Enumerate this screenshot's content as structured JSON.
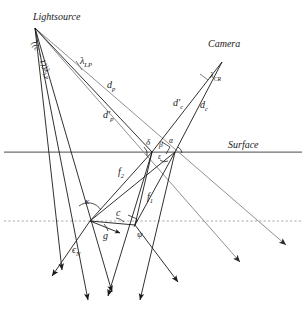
{
  "figure": {
    "type": "ray-diagram",
    "background": "#ffffff",
    "width": 306,
    "height": 319
  },
  "colors": {
    "ray_black": "#1a1a1a",
    "ray_gray": "#8a8a8a",
    "surface_line": "#6e6e6e",
    "dashed_line": "#a8a8a8",
    "text": "#1a1a1a"
  },
  "labels": {
    "lightsource": "Lightsource",
    "camera": "Camera",
    "surface": "Surface",
    "lambda_lp": "λ",
    "lambda_lp_sub": "LP",
    "cone_width": "((c − 1))λ",
    "cone_width_sub": "LP",
    "d_p": "d",
    "d_p_sub": "p",
    "d_p_prime": "d′",
    "d_p_prime_sub": "p",
    "lambda_cr": "λ",
    "lambda_cr_sub": "CR",
    "d_c": "d",
    "d_c_sub": "c",
    "d_c_prime": "d′",
    "d_c_prime_sub": "c",
    "f1": "f",
    "f1_sub": "1",
    "f2": "f",
    "f2_sub": "2",
    "delta": "δ",
    "beta": "β",
    "alpha": "α",
    "epsilon": "ε",
    "kappa": "κ",
    "c_label": "c",
    "g_label": "g",
    "psi": "ψ",
    "epsilon_n": "ϵ",
    "epsilon_n_sub": "N"
  },
  "geometry": {
    "lightsource_apex": [
      35,
      28
    ],
    "camera_apex": [
      222,
      62
    ],
    "surface_y": 152,
    "dashed_y": 221,
    "vertex_left": [
      90,
      221
    ],
    "vertex_right": [
      135,
      225
    ],
    "surface_hit_left": [
      152,
      152
    ],
    "surface_hit_right": [
      175,
      152
    ]
  }
}
